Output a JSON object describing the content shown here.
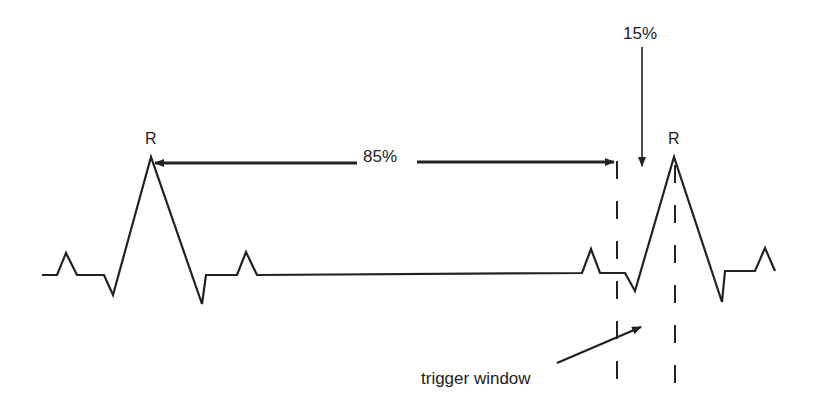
{
  "diagram": {
    "labels": {
      "r_peak_1": "R",
      "r_peak_2": "R",
      "interval_percent": "85%",
      "window_percent": "15%",
      "trigger_window": "trigger window"
    },
    "colors": {
      "stroke": "#222222",
      "background": "#ffffff"
    },
    "waveform_points": "42,275 57,275 66,253 77,275 104,275 113,295 151,157 202,304 206,275 237,275 246,252 257,275 582,273 591,249 600,273 625,273 635,291 674,157 722,302 725,271 755,271 765,248 775,271"
  }
}
